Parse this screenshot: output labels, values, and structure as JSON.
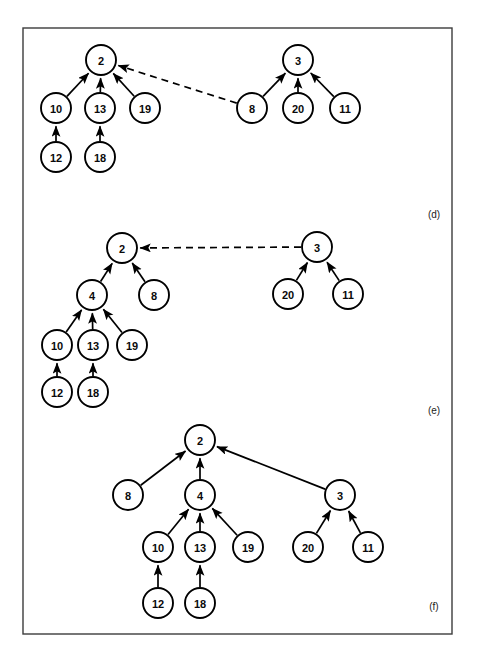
{
  "figure": {
    "frame": {
      "x": 23,
      "y": 28,
      "width": 429,
      "height": 606,
      "color": "#3c3c3c"
    },
    "node_radius": 15,
    "node_fill": "#ffffff",
    "node_stroke": "#000000",
    "panels": [
      {
        "id": "d",
        "label": "(d)",
        "label_pos": {
          "x": 434,
          "y": 214
        },
        "nodes": [
          {
            "id": "d2",
            "text": "2",
            "x": 101,
            "y": 60
          },
          {
            "id": "d10",
            "text": "10",
            "x": 56,
            "y": 108
          },
          {
            "id": "d13",
            "text": "13",
            "x": 100,
            "y": 108
          },
          {
            "id": "d19",
            "text": "19",
            "x": 145,
            "y": 108
          },
          {
            "id": "d12",
            "text": "12",
            "x": 56,
            "y": 157
          },
          {
            "id": "d18",
            "text": "18",
            "x": 100,
            "y": 157
          },
          {
            "id": "d3",
            "text": "3",
            "x": 298,
            "y": 60
          },
          {
            "id": "d8",
            "text": "8",
            "x": 252,
            "y": 108
          },
          {
            "id": "d20",
            "text": "20",
            "x": 298,
            "y": 108
          },
          {
            "id": "d11",
            "text": "11",
            "x": 345,
            "y": 108
          }
        ],
        "edges": [
          {
            "from": "d10",
            "to": "d2",
            "style": "solid"
          },
          {
            "from": "d13",
            "to": "d2",
            "style": "solid"
          },
          {
            "from": "d19",
            "to": "d2",
            "style": "solid"
          },
          {
            "from": "d12",
            "to": "d10",
            "style": "solid"
          },
          {
            "from": "d18",
            "to": "d13",
            "style": "solid"
          },
          {
            "from": "d8",
            "to": "d2",
            "style": "dashed"
          },
          {
            "from": "d8",
            "to": "d3",
            "style": "solid"
          },
          {
            "from": "d20",
            "to": "d3",
            "style": "solid"
          },
          {
            "from": "d11",
            "to": "d3",
            "style": "solid"
          }
        ]
      },
      {
        "id": "e",
        "label": "(e)",
        "label_pos": {
          "x": 434,
          "y": 410
        },
        "nodes": [
          {
            "id": "e2",
            "text": "2",
            "x": 122,
            "y": 248
          },
          {
            "id": "e4",
            "text": "4",
            "x": 92,
            "y": 295
          },
          {
            "id": "e8",
            "text": "8",
            "x": 154,
            "y": 295
          },
          {
            "id": "e10",
            "text": "10",
            "x": 57,
            "y": 345
          },
          {
            "id": "e13",
            "text": "13",
            "x": 93,
            "y": 345
          },
          {
            "id": "e19",
            "text": "19",
            "x": 132,
            "y": 345
          },
          {
            "id": "e12",
            "text": "12",
            "x": 57,
            "y": 392
          },
          {
            "id": "e18",
            "text": "18",
            "x": 93,
            "y": 392
          },
          {
            "id": "e3",
            "text": "3",
            "x": 317,
            "y": 247
          },
          {
            "id": "e20",
            "text": "20",
            "x": 288,
            "y": 294
          },
          {
            "id": "e11",
            "text": "11",
            "x": 348,
            "y": 294
          }
        ],
        "edges": [
          {
            "from": "e4",
            "to": "e2",
            "style": "solid"
          },
          {
            "from": "e8",
            "to": "e2",
            "style": "solid"
          },
          {
            "from": "e10",
            "to": "e4",
            "style": "solid"
          },
          {
            "from": "e13",
            "to": "e4",
            "style": "solid"
          },
          {
            "from": "e19",
            "to": "e4",
            "style": "solid"
          },
          {
            "from": "e12",
            "to": "e10",
            "style": "solid"
          },
          {
            "from": "e18",
            "to": "e13",
            "style": "solid"
          },
          {
            "from": "e3",
            "to": "e2",
            "style": "dashed"
          },
          {
            "from": "e20",
            "to": "e3",
            "style": "solid"
          },
          {
            "from": "e11",
            "to": "e3",
            "style": "solid"
          }
        ]
      },
      {
        "id": "f",
        "label": "(f)",
        "label_pos": {
          "x": 434,
          "y": 606
        },
        "nodes": [
          {
            "id": "f2",
            "text": "2",
            "x": 200,
            "y": 440
          },
          {
            "id": "f8",
            "text": "8",
            "x": 128,
            "y": 495
          },
          {
            "id": "f4",
            "text": "4",
            "x": 200,
            "y": 495
          },
          {
            "id": "f3",
            "text": "3",
            "x": 340,
            "y": 495
          },
          {
            "id": "f10",
            "text": "10",
            "x": 158,
            "y": 547
          },
          {
            "id": "f13",
            "text": "13",
            "x": 200,
            "y": 547
          },
          {
            "id": "f19",
            "text": "19",
            "x": 248,
            "y": 547
          },
          {
            "id": "f20",
            "text": "20",
            "x": 308,
            "y": 547
          },
          {
            "id": "f11",
            "text": "11",
            "x": 368,
            "y": 547
          },
          {
            "id": "f12",
            "text": "12",
            "x": 158,
            "y": 603
          },
          {
            "id": "f18",
            "text": "18",
            "x": 200,
            "y": 603
          }
        ],
        "edges": [
          {
            "from": "f8",
            "to": "f2",
            "style": "solid"
          },
          {
            "from": "f4",
            "to": "f2",
            "style": "solid"
          },
          {
            "from": "f3",
            "to": "f2",
            "style": "solid"
          },
          {
            "from": "f10",
            "to": "f4",
            "style": "solid"
          },
          {
            "from": "f13",
            "to": "f4",
            "style": "solid"
          },
          {
            "from": "f19",
            "to": "f4",
            "style": "solid"
          },
          {
            "from": "f20",
            "to": "f3",
            "style": "solid"
          },
          {
            "from": "f11",
            "to": "f3",
            "style": "solid"
          },
          {
            "from": "f12",
            "to": "f10",
            "style": "solid"
          },
          {
            "from": "f18",
            "to": "f13",
            "style": "solid"
          }
        ]
      }
    ]
  }
}
